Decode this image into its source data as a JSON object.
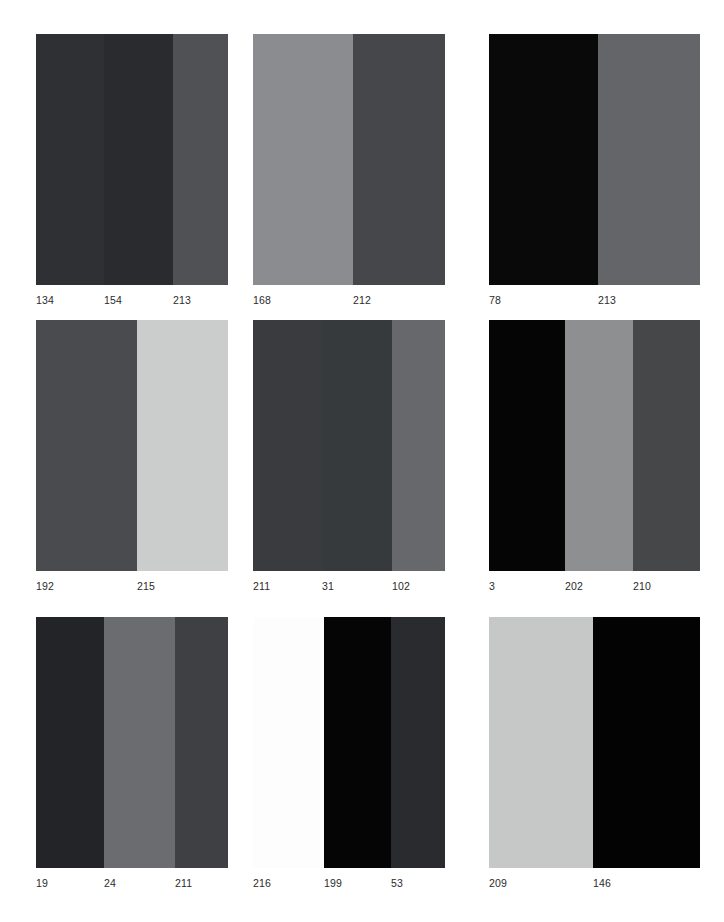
{
  "page": {
    "background": "#ffffff",
    "width": 724,
    "height": 922,
    "label_color": "#2b2b2b"
  },
  "grid": {
    "rows": 3,
    "columns": 3,
    "panel_left": [
      36,
      253,
      489
    ],
    "panel_top": [
      34,
      320,
      617
    ],
    "panel_width": 192,
    "panel_height": [
      251,
      251,
      251
    ],
    "label_offset": 8
  },
  "panels": [
    {
      "id": "panel-1",
      "row": 1,
      "col": 1,
      "left": 36,
      "top": 34,
      "width": 192,
      "height": 251,
      "bands": [
        {
          "label": "134",
          "color": "#2f3034",
          "width": 68,
          "label_x": 0
        },
        {
          "label": "154",
          "color": "#2a2b2f",
          "width": 69,
          "label_x": 68
        },
        {
          "label": "213",
          "color": "#4f5155",
          "width": 55,
          "label_x": 137
        }
      ]
    },
    {
      "id": "panel-2",
      "row": 1,
      "col": 2,
      "left": 253,
      "top": 34,
      "width": 192,
      "height": 251,
      "bands": [
        {
          "label": "168",
          "color": "#8a8c8f",
          "width": 100,
          "label_x": 0
        },
        {
          "label": "212",
          "color": "#45474b",
          "width": 92,
          "label_x": 100
        }
      ]
    },
    {
      "id": "panel-3",
      "row": 1,
      "col": 3,
      "left": 489,
      "top": 34,
      "width": 211,
      "height": 251,
      "bands": [
        {
          "label": "78",
          "color": "#09090a",
          "width": 109,
          "label_x": 0
        },
        {
          "label": "213",
          "color": "#636568",
          "width": 102,
          "label_x": 109
        }
      ]
    },
    {
      "id": "panel-4",
      "row": 2,
      "col": 1,
      "left": 36,
      "top": 320,
      "width": 192,
      "height": 251,
      "bands": [
        {
          "label": "192",
          "color": "#4a4b4f",
          "width": 101,
          "label_x": 0
        },
        {
          "label": "215",
          "color": "#cbcdcd",
          "width": 91,
          "label_x": 101
        }
      ]
    },
    {
      "id": "panel-5",
      "row": 2,
      "col": 2,
      "left": 253,
      "top": 320,
      "width": 192,
      "height": 251,
      "bands": [
        {
          "label": "211",
          "color": "#3a3b3f",
          "width": 69,
          "label_x": 0
        },
        {
          "label": "31",
          "color": "#373a3d",
          "width": 70,
          "label_x": 69
        },
        {
          "label": "102",
          "color": "#66686b",
          "width": 53,
          "label_x": 139
        }
      ]
    },
    {
      "id": "panel-6",
      "row": 2,
      "col": 3,
      "left": 489,
      "top": 320,
      "width": 211,
      "height": 251,
      "bands": [
        {
          "label": "3",
          "color": "#050506",
          "width": 76,
          "label_x": 0
        },
        {
          "label": "202",
          "color": "#8d8f90",
          "width": 68,
          "label_x": 76
        },
        {
          "label": "210",
          "color": "#464749",
          "width": 67,
          "label_x": 144
        }
      ]
    },
    {
      "id": "panel-7",
      "row": 3,
      "col": 1,
      "left": 36,
      "top": 617,
      "width": 192,
      "height": 251,
      "bands": [
        {
          "label": "19",
          "color": "#232427",
          "width": 68,
          "label_x": 0
        },
        {
          "label": "24",
          "color": "#6a6c6f",
          "width": 71,
          "label_x": 68
        },
        {
          "label": "211",
          "color": "#3e4043",
          "width": 53,
          "label_x": 139
        }
      ]
    },
    {
      "id": "panel-8",
      "row": 3,
      "col": 2,
      "left": 253,
      "top": 617,
      "width": 192,
      "height": 251,
      "bands": [
        {
          "label": "216",
          "color": "#fdfdfd",
          "width": 71,
          "label_x": 0
        },
        {
          "label": "199",
          "color": "#050506",
          "width": 67,
          "label_x": 71
        },
        {
          "label": "53",
          "color": "#2a2b2e",
          "width": 54,
          "label_x": 138
        }
      ]
    },
    {
      "id": "panel-9",
      "row": 3,
      "col": 3,
      "left": 489,
      "top": 617,
      "width": 211,
      "height": 251,
      "bands": [
        {
          "label": "209",
          "color": "#c6c8c8",
          "width": 104,
          "label_x": 0
        },
        {
          "label": "146",
          "color": "#030304",
          "width": 107,
          "label_x": 104
        }
      ]
    }
  ]
}
